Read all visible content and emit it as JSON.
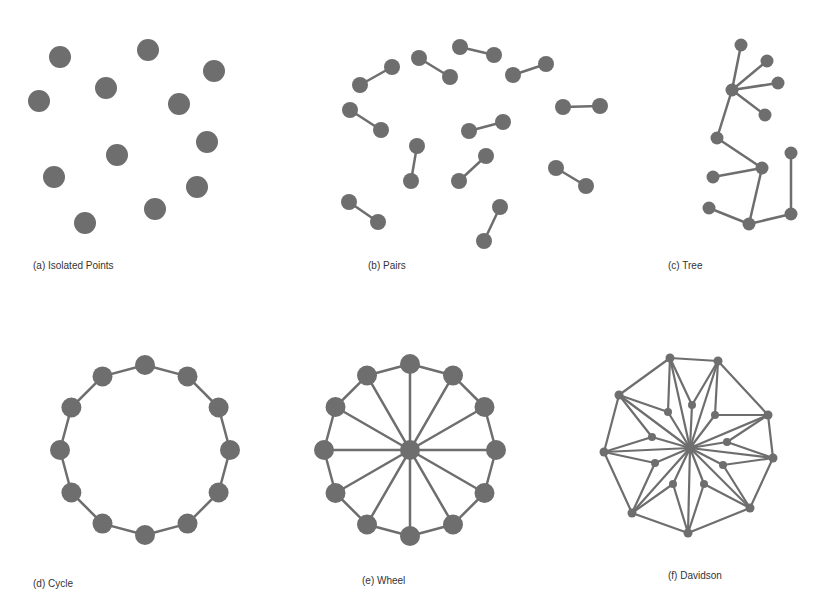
{
  "colors": {
    "node": "#6e6e6e",
    "edge": "#6e6e6e",
    "caption": "#333333",
    "background": "#ffffff"
  },
  "panels": [
    {
      "id": "isolated-points",
      "caption": "(a) Isolated Points",
      "caption_pos": [
        33,
        260
      ],
      "node_radius": 11,
      "edge_width": 2.5,
      "nodes": [
        [
          60,
          57
        ],
        [
          148,
          50
        ],
        [
          214,
          71
        ],
        [
          39,
          101
        ],
        [
          106,
          88
        ],
        [
          179,
          104
        ],
        [
          117,
          155
        ],
        [
          207,
          142
        ],
        [
          54,
          177
        ],
        [
          197,
          187
        ],
        [
          155,
          209
        ],
        [
          85,
          223
        ]
      ],
      "edges": []
    },
    {
      "id": "pairs",
      "caption": "(b) Pairs",
      "caption_pos": [
        368,
        260
      ],
      "node_radius": 8,
      "edge_width": 2.5,
      "nodes": [
        [
          360,
          85
        ],
        [
          392,
          67
        ],
        [
          419,
          58
        ],
        [
          450,
          77
        ],
        [
          460,
          47
        ],
        [
          494,
          55
        ],
        [
          513,
          75
        ],
        [
          546,
          64
        ],
        [
          350,
          110
        ],
        [
          381,
          130
        ],
        [
          563,
          107
        ],
        [
          600,
          106
        ],
        [
          469,
          131
        ],
        [
          503,
          122
        ],
        [
          417,
          146
        ],
        [
          411,
          181
        ],
        [
          459,
          181
        ],
        [
          486,
          156
        ],
        [
          556,
          168
        ],
        [
          586,
          186
        ],
        [
          349,
          202
        ],
        [
          378,
          222
        ],
        [
          500,
          207
        ],
        [
          484,
          241
        ]
      ],
      "edges": [
        [
          0,
          1
        ],
        [
          2,
          3
        ],
        [
          4,
          5
        ],
        [
          6,
          7
        ],
        [
          8,
          9
        ],
        [
          10,
          11
        ],
        [
          12,
          13
        ],
        [
          14,
          15
        ],
        [
          16,
          17
        ],
        [
          18,
          19
        ],
        [
          20,
          21
        ],
        [
          22,
          23
        ]
      ]
    },
    {
      "id": "tree",
      "caption": "(c) Tree",
      "caption_pos": [
        668,
        260
      ],
      "node_radius": 6.5,
      "edge_width": 2.5,
      "nodes": [
        [
          741,
          45
        ],
        [
          767,
          61
        ],
        [
          778,
          83
        ],
        [
          732,
          90
        ],
        [
          765,
          115
        ],
        [
          717,
          138
        ],
        [
          762,
          168
        ],
        [
          713,
          177
        ],
        [
          791,
          153
        ],
        [
          709,
          208
        ],
        [
          749,
          224
        ],
        [
          791,
          214
        ]
      ],
      "edges": [
        [
          0,
          3
        ],
        [
          1,
          3
        ],
        [
          2,
          3
        ],
        [
          4,
          3
        ],
        [
          3,
          5
        ],
        [
          5,
          6
        ],
        [
          6,
          7
        ],
        [
          6,
          10
        ],
        [
          9,
          10
        ],
        [
          10,
          11
        ],
        [
          11,
          8
        ]
      ]
    },
    {
      "id": "cycle",
      "caption": "(d) Cycle",
      "caption_pos": [
        33,
        578
      ],
      "node_radius": 10,
      "edge_width": 2.5,
      "generator": "cycle",
      "center": [
        145,
        450
      ],
      "radius": 85,
      "count": 12
    },
    {
      "id": "wheel",
      "caption": "(e) Wheel",
      "caption_pos": [
        362,
        575
      ],
      "node_radius": 10,
      "edge_width": 2.5,
      "generator": "wheel",
      "center": [
        410,
        450
      ],
      "radius": 86,
      "count": 12
    },
    {
      "id": "davidson",
      "caption": "(f) Davidson",
      "caption_pos": [
        668,
        570
      ],
      "node_radius": 4.5,
      "inner_node_radius": 4,
      "edge_width": 2.2,
      "center": [
        690,
        448
      ],
      "outer": [
        [
          670,
          358
        ],
        [
          718,
          361
        ],
        [
          768,
          415
        ],
        [
          773,
          458
        ],
        [
          750,
          508
        ],
        [
          688,
          533
        ],
        [
          632,
          513
        ],
        [
          604,
          452
        ],
        [
          619,
          395
        ]
      ],
      "inner": [
        [
          692,
          405
        ],
        [
          715,
          415
        ],
        [
          727,
          442
        ],
        [
          723,
          465
        ],
        [
          704,
          484
        ],
        [
          673,
          484
        ],
        [
          655,
          463
        ],
        [
          652,
          437
        ],
        [
          668,
          412
        ]
      ]
    }
  ]
}
